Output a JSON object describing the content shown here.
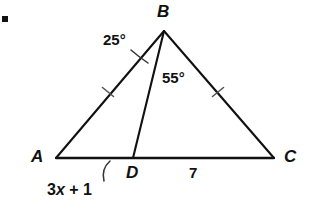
{
  "figure": {
    "type": "geometry-diagram",
    "bullet_marker": "■",
    "stroke_color": "#111111",
    "background_color": "#ffffff",
    "vertices": [
      {
        "name": "A",
        "label": "A",
        "x": 56,
        "y": 158,
        "label_x": 31,
        "label_y": 150
      },
      {
        "name": "B",
        "label": "B",
        "x": 164,
        "y": 31,
        "label_x": 157,
        "label_y": 4
      },
      {
        "name": "C",
        "label": "C",
        "x": 274,
        "y": 158,
        "label_x": 284,
        "label_y": 150
      },
      {
        "name": "D",
        "label": "D",
        "x": 133,
        "y": 158,
        "label_x": 126,
        "label_y": 165
      }
    ],
    "segments": [
      {
        "name": "side-AB",
        "from": "A",
        "to": "B"
      },
      {
        "name": "side-BC",
        "from": "B",
        "to": "C"
      },
      {
        "name": "base-AC",
        "from": "A",
        "to": "C"
      },
      {
        "name": "cevian-BD",
        "from": "B",
        "to": "D"
      }
    ],
    "tick_marks": [
      {
        "name": "tick-AB",
        "on": "side-AB",
        "x": 108,
        "y": 92,
        "count": 1
      },
      {
        "name": "tick-BC",
        "on": "side-BC",
        "x": 218,
        "y": 92,
        "count": 1
      }
    ],
    "angles": [
      {
        "name": "angle-ABD",
        "label": "25°",
        "value": 25,
        "at_vertex": "B",
        "between": [
          "A",
          "D"
        ],
        "label_x": 103,
        "label_y": 31
      },
      {
        "name": "angle-DBC",
        "label": "55°",
        "value": 55,
        "at_vertex": "B",
        "between": [
          "D",
          "C"
        ],
        "label_x": 162,
        "label_y": 70
      }
    ],
    "length_labels": [
      {
        "name": "length-AD",
        "text_parts": {
          "coefficient": "3",
          "variable": "x",
          "operator": " + ",
          "constant": "1"
        },
        "text": "3x + 1",
        "on": "segment-AD",
        "label_x": 47,
        "label_y": 182
      },
      {
        "name": "length-DC",
        "text": "7",
        "on": "segment-DC",
        "label_x": 189,
        "label_y": 166
      }
    ]
  }
}
